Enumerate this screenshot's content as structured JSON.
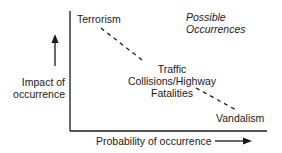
{
  "diagram": {
    "y_axis_label": [
      "Impact of",
      "occurrence"
    ],
    "x_axis_label": "Probability of occurrence",
    "legend_title": [
      "Possible",
      "Occurrences"
    ],
    "items": [
      {
        "label": "Terrorism"
      },
      {
        "label_lines": [
          "Traffic",
          "Collisions/Highway",
          "Fatalities"
        ]
      },
      {
        "label": "Vandalism"
      }
    ],
    "colors": {
      "ink": "#1a1a1a",
      "background": "#ffffff"
    }
  }
}
